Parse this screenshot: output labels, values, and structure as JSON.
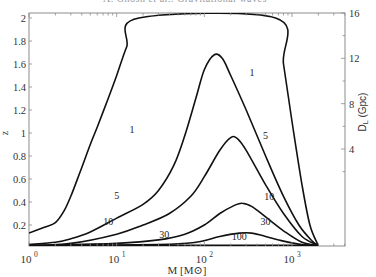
{
  "running_header": "A. Ghosh et al.: Gravitational waves",
  "chart_data": {
    "type": "line",
    "title": "",
    "xlabel": "M [M⊙]",
    "ylabel": "z",
    "y2label": "D_L (Gpc)",
    "xscale": "log",
    "xlim": [
      1,
      4000
    ],
    "ylim": [
      0.02,
      2
    ],
    "x_ticks": [
      {
        "value": 1,
        "label_base": "10",
        "label_exp": "0"
      },
      {
        "value": 10,
        "label_base": "10",
        "label_exp": "1"
      },
      {
        "value": 100,
        "label_base": "10",
        "label_exp": "2"
      },
      {
        "value": 1000,
        "label_base": "10",
        "label_exp": "3"
      }
    ],
    "y_ticks": [
      0.2,
      0.4,
      0.6,
      0.8,
      1,
      1.2,
      1.4,
      1.6,
      1.8,
      2
    ],
    "y_tick_labels": [
      "0.2",
      "0.4",
      "0.6",
      "0.8",
      "1",
      "1.2",
      "1.4",
      "1.6",
      "1.8",
      "2"
    ],
    "y2_ticks": [
      4,
      8,
      12,
      16
    ],
    "y2_tick_labels": [
      "4",
      "8",
      "12",
      "16"
    ],
    "grid": false,
    "legend": "none (contour labels inline)",
    "series": [
      {
        "name": "1",
        "points": [
          [
            1,
            0.13
          ],
          [
            1.5,
            0.18
          ],
          [
            2,
            0.22
          ],
          [
            2.5,
            0.32
          ],
          [
            3,
            0.45
          ],
          [
            4,
            0.7
          ],
          [
            5,
            0.9
          ],
          [
            6,
            1.05
          ],
          [
            8,
            1.3
          ],
          [
            10,
            1.5
          ],
          [
            13,
            1.75
          ],
          [
            18,
            2.0
          ],
          [
            650,
            2.0
          ],
          [
            800,
            1.6
          ],
          [
            1000,
            1.1
          ],
          [
            1300,
            0.55
          ],
          [
            1600,
            0.2
          ],
          [
            2000,
            0.02
          ]
        ],
        "label_pos": [
          15,
          1.0
        ]
      },
      {
        "name": "5",
        "points": [
          [
            1,
            0.03
          ],
          [
            2,
            0.05
          ],
          [
            3,
            0.08
          ],
          [
            5,
            0.14
          ],
          [
            10,
            0.26
          ],
          [
            20,
            0.38
          ],
          [
            30,
            0.5
          ],
          [
            45,
            0.72
          ],
          [
            60,
            0.98
          ],
          [
            80,
            1.3
          ],
          [
            100,
            1.55
          ],
          [
            130,
            1.68
          ],
          [
            160,
            1.65
          ],
          [
            200,
            1.5
          ],
          [
            300,
            1.2
          ],
          [
            500,
            0.8
          ],
          [
            800,
            0.45
          ],
          [
            1200,
            0.2
          ],
          [
            1700,
            0.06
          ],
          [
            2000,
            0.02
          ]
        ],
        "label_pos": [
          10,
          0.43
        ]
      },
      {
        "name": "10",
        "points": [
          [
            1,
            0.02
          ],
          [
            3,
            0.04
          ],
          [
            10,
            0.12
          ],
          [
            20,
            0.2
          ],
          [
            40,
            0.3
          ],
          [
            70,
            0.45
          ],
          [
            100,
            0.62
          ],
          [
            150,
            0.85
          ],
          [
            200,
            0.96
          ],
          [
            240,
            0.95
          ],
          [
            300,
            0.85
          ],
          [
            500,
            0.55
          ],
          [
            800,
            0.3
          ],
          [
            1300,
            0.1
          ],
          [
            2000,
            0.02
          ]
        ],
        "label_pos": [
          8,
          0.2
        ]
      },
      {
        "name": "30",
        "points": [
          [
            1,
            0.02
          ],
          [
            10,
            0.04
          ],
          [
            30,
            0.07
          ],
          [
            60,
            0.12
          ],
          [
            100,
            0.2
          ],
          [
            150,
            0.3
          ],
          [
            220,
            0.37
          ],
          [
            270,
            0.39
          ],
          [
            350,
            0.36
          ],
          [
            500,
            0.27
          ],
          [
            800,
            0.15
          ],
          [
            1300,
            0.05
          ],
          [
            2000,
            0.02
          ]
        ],
        "label_pos": [
          35,
          0.09
        ]
      },
      {
        "name": "100",
        "points": [
          [
            1,
            0.02
          ],
          [
            30,
            0.03
          ],
          [
            80,
            0.05
          ],
          [
            150,
            0.1
          ],
          [
            250,
            0.13
          ],
          [
            350,
            0.13
          ],
          [
            500,
            0.1
          ],
          [
            800,
            0.06
          ],
          [
            1300,
            0.03
          ],
          [
            2000,
            0.02
          ]
        ],
        "label_pos": [
          250,
          0.07
        ]
      }
    ],
    "extra_labels": [
      {
        "text": "1",
        "pos": [
          350,
          1.5
        ]
      },
      {
        "text": "5",
        "pos": [
          500,
          0.95
        ]
      },
      {
        "text": "10",
        "pos": [
          550,
          0.42
        ]
      },
      {
        "text": "30",
        "pos": [
          500,
          0.2
        ]
      }
    ]
  }
}
